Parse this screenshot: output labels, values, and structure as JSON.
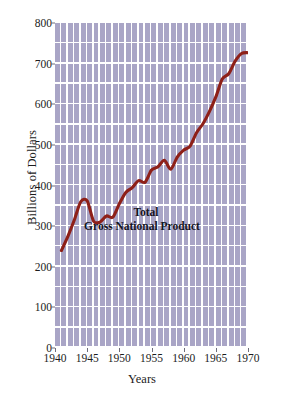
{
  "chart_data": {
    "type": "line",
    "title": "",
    "annotation_lines": [
      "Total",
      "Gross National Product"
    ],
    "xlabel": "Years",
    "ylabel": "Billions of Dollars",
    "xlim": [
      1940,
      1970
    ],
    "ylim": [
      0,
      800
    ],
    "xticks": [
      1940,
      1945,
      1950,
      1955,
      1960,
      1965,
      1970
    ],
    "xticklabels": [
      "1940",
      "1945",
      "1950",
      "1955",
      "1960",
      "1965",
      "1970"
    ],
    "yticks": [
      0,
      100,
      200,
      300,
      400,
      500,
      600,
      700,
      800
    ],
    "yticklabels": [
      "0",
      "100",
      "200",
      "300",
      "400",
      "500",
      "600",
      "700",
      "800"
    ],
    "grid": true,
    "grid_style": "vertical-bars-with-horizontal-rules",
    "legend": "none",
    "series": [
      {
        "name": "Total Gross National Product",
        "color": "#8e2018",
        "x": [
          1941,
          1942,
          1943,
          1944,
          1945,
          1946,
          1947,
          1948,
          1949,
          1950,
          1951,
          1952,
          1953,
          1954,
          1955,
          1956,
          1957,
          1958,
          1959,
          1960,
          1961,
          1962,
          1963,
          1964,
          1965,
          1966,
          1967,
          1968,
          1969,
          1970
        ],
        "values": [
          240,
          275,
          315,
          360,
          362,
          312,
          310,
          325,
          322,
          355,
          383,
          395,
          412,
          408,
          438,
          446,
          462,
          440,
          470,
          487,
          497,
          530,
          552,
          582,
          618,
          662,
          675,
          706,
          725,
          727
        ]
      }
    ],
    "colors": {
      "line": "#8e2018",
      "plot_background": "#a9a5c6",
      "gridline": "#ffffff",
      "text": "#1c1c1c",
      "annotation_text": "#14141e",
      "page_background": "#ffffff"
    }
  }
}
